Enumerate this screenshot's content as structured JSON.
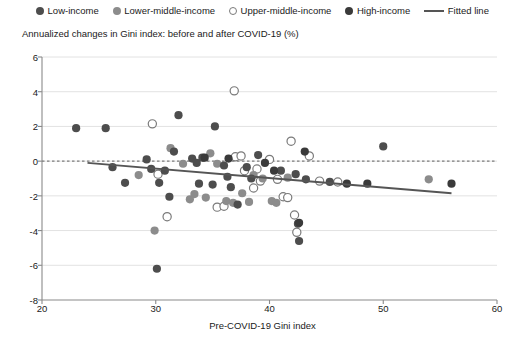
{
  "chart_data": {
    "type": "scatter",
    "title": "",
    "ylabel": "Annualized changes in Gini index: before and after COVID-19 (%)",
    "xlabel": "Pre-COVID-19 Gini index",
    "xlim": [
      20,
      60
    ],
    "ylim": [
      -8,
      6
    ],
    "xticks": [
      20,
      30,
      40,
      50,
      60
    ],
    "yticks": [
      -8,
      -6,
      -4,
      -2,
      0,
      2,
      4,
      6
    ],
    "grid": true,
    "zero_line": true,
    "legend_position": "top-center",
    "colors": {
      "low_income": "#4d4d4d",
      "lower_middle_income": "#8c8c8c",
      "upper_middle_income": "#ffffff",
      "upper_middle_income_edge": "#7a7a7a",
      "high_income": "#3a3a3a",
      "fitted_line": "#555555",
      "grid": "#e2e2e2",
      "axis": "#8a8a8a",
      "zero_line": "#7c7c7c"
    },
    "legend": [
      {
        "label": "Low-income",
        "marker": "filled-circle",
        "color": "#4d4d4d"
      },
      {
        "label": "Lower-middle-income",
        "marker": "filled-circle",
        "color": "#8c8c8c"
      },
      {
        "label": "Upper-middle-income",
        "marker": "open-circle",
        "color": "#ffffff"
      },
      {
        "label": "High-income",
        "marker": "filled-circle",
        "color": "#3a3a3a"
      },
      {
        "label": "Fitted line",
        "marker": "line",
        "color": "#555555"
      }
    ],
    "fitted_line": {
      "x0": 24.0,
      "y0": -0.1,
      "x1": 56.0,
      "y1": -1.85
    },
    "series": [
      {
        "name": "Low-income",
        "marker": "filled-circle",
        "color": "#4d4d4d",
        "points": [
          [
            23.0,
            1.9
          ],
          [
            25.6,
            1.9
          ],
          [
            26.2,
            -0.35
          ],
          [
            27.3,
            -1.25
          ],
          [
            29.2,
            0.1
          ],
          [
            29.6,
            -0.45
          ],
          [
            30.3,
            -1.25
          ],
          [
            30.8,
            -0.55
          ],
          [
            30.1,
            -6.2
          ],
          [
            31.2,
            -2.05
          ],
          [
            31.6,
            0.55
          ],
          [
            32.0,
            2.65
          ],
          [
            33.2,
            0.15
          ],
          [
            33.6,
            -0.1
          ],
          [
            33.8,
            -1.3
          ],
          [
            34.1,
            0.2
          ],
          [
            35.2,
            2.0
          ],
          [
            35.0,
            -1.35
          ],
          [
            36.0,
            -0.25
          ],
          [
            36.3,
            -0.9
          ],
          [
            36.6,
            -1.5
          ],
          [
            37.2,
            -2.5
          ],
          [
            38.0,
            -0.35
          ],
          [
            38.4,
            -1.0
          ],
          [
            39.0,
            0.35
          ],
          [
            41.0,
            -0.55
          ],
          [
            42.3,
            -0.75
          ],
          [
            42.5,
            -3.6
          ],
          [
            42.6,
            -4.6
          ],
          [
            43.2,
            -1.05
          ],
          [
            45.3,
            -1.2
          ],
          [
            50.0,
            0.85
          ]
        ]
      },
      {
        "name": "Lower-middle-income",
        "marker": "filled-circle",
        "color": "#8c8c8c",
        "points": [
          [
            28.5,
            -0.8
          ],
          [
            29.9,
            -4.0
          ],
          [
            31.3,
            0.75
          ],
          [
            32.4,
            -0.15
          ],
          [
            33.0,
            -2.2
          ],
          [
            33.4,
            -1.9
          ],
          [
            34.4,
            -2.1
          ],
          [
            34.8,
            0.45
          ],
          [
            35.4,
            -0.15
          ],
          [
            36.2,
            -2.3
          ],
          [
            36.8,
            -2.4
          ],
          [
            37.6,
            -1.85
          ],
          [
            38.2,
            -2.35
          ],
          [
            38.6,
            -0.8
          ],
          [
            39.4,
            -1.0
          ],
          [
            40.2,
            -2.3
          ],
          [
            40.6,
            -2.4
          ],
          [
            41.6,
            -0.95
          ],
          [
            54.0,
            -1.05
          ]
        ]
      },
      {
        "name": "Upper-middle-income",
        "marker": "open-circle",
        "color": "#ffffff",
        "edge": "#7a7a7a",
        "points": [
          [
            29.7,
            2.15
          ],
          [
            30.2,
            -0.75
          ],
          [
            31.0,
            -3.2
          ],
          [
            35.4,
            -2.65
          ],
          [
            36.0,
            -2.6
          ],
          [
            36.9,
            4.05
          ],
          [
            37.0,
            0.25
          ],
          [
            37.5,
            0.3
          ],
          [
            37.8,
            -0.55
          ],
          [
            38.6,
            -1.55
          ],
          [
            38.9,
            -0.45
          ],
          [
            39.2,
            -1.15
          ],
          [
            40.0,
            0.1
          ],
          [
            40.7,
            -1.05
          ],
          [
            41.2,
            -2.05
          ],
          [
            41.6,
            -2.1
          ],
          [
            41.9,
            1.15
          ],
          [
            42.2,
            -3.1
          ],
          [
            42.4,
            -4.1
          ],
          [
            43.5,
            0.3
          ],
          [
            44.4,
            -1.15
          ],
          [
            46.0,
            -1.2
          ]
        ]
      },
      {
        "name": "High-income",
        "marker": "filled-circle",
        "color": "#3a3a3a",
        "points": [
          [
            34.3,
            0.2
          ],
          [
            36.4,
            0.15
          ],
          [
            39.6,
            -0.1
          ],
          [
            40.4,
            -0.55
          ],
          [
            42.6,
            -3.55
          ],
          [
            43.1,
            0.55
          ],
          [
            46.8,
            -1.3
          ],
          [
            48.6,
            -1.3
          ],
          [
            56.0,
            -1.3
          ]
        ]
      }
    ]
  }
}
